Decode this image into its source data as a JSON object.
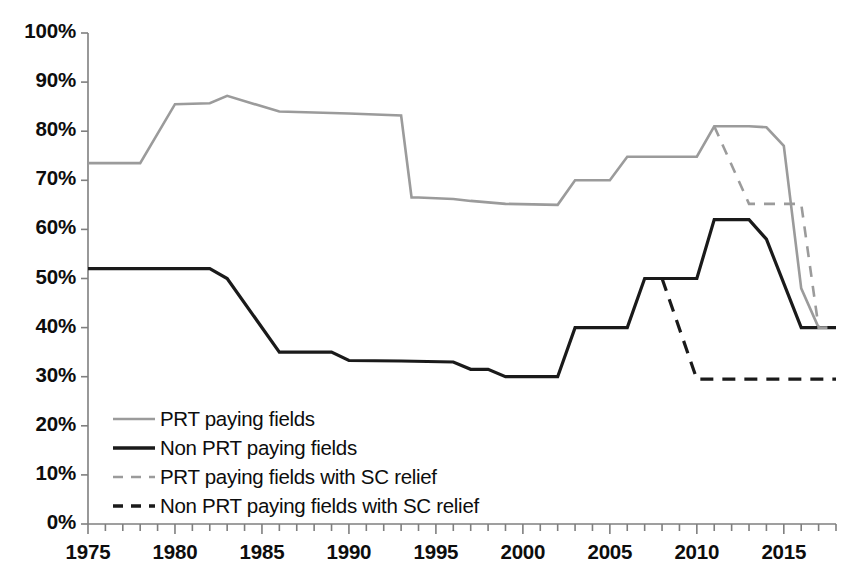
{
  "chart_data": {
    "type": "line",
    "title": "",
    "xlabel": "",
    "ylabel": "",
    "xlim": [
      1975,
      2018
    ],
    "ylim": [
      0,
      100
    ],
    "grid": false,
    "legend_position": "inside-bottom-left",
    "y_tick_labels": [
      "100%",
      "90%",
      "80%",
      "70%",
      "60%",
      "50%",
      "40%",
      "30%",
      "20%",
      "10%",
      "0%"
    ],
    "y_tick_values": [
      100,
      90,
      80,
      70,
      60,
      50,
      40,
      30,
      20,
      10,
      0
    ],
    "x_tick_labels": [
      "1975",
      "1980",
      "1985",
      "1990",
      "1995",
      "2000",
      "2005",
      "2010",
      "2015"
    ],
    "x_tick_values": [
      1975,
      1980,
      1985,
      1990,
      1995,
      2000,
      2005,
      2010,
      2015
    ],
    "x_minor_tick_interval": 1,
    "colors": {
      "prt_paying_fields": "#9b9b9b",
      "non_prt_paying_fields": "#1a1a1a",
      "prt_paying_fields_sc_relief": "#9b9b9b",
      "non_prt_paying_fields_sc_relief": "#1a1a1a",
      "axis": "#7f7f7f",
      "text": "#0d0d0d",
      "background": "#ffffff"
    },
    "series": [
      {
        "name": "PRT paying fields",
        "style": "solid",
        "color": "#9b9b9b",
        "width": 2.6,
        "x": [
          1975,
          1978,
          1980,
          1982,
          1983,
          1986,
          1990,
          1993,
          1993.6,
          1994,
          1996,
          1997,
          1999,
          2002,
          2003,
          2005,
          2006,
          2009,
          2010,
          2011,
          2013,
          2014,
          2015,
          2016,
          2017,
          2018
        ],
        "y": [
          73.5,
          73.5,
          85.5,
          85.7,
          87.2,
          84.0,
          83.6,
          83.2,
          66.5,
          66.5,
          66.2,
          65.8,
          65.2,
          65.0,
          70.0,
          70.0,
          74.8,
          74.8,
          74.8,
          81.0,
          81.0,
          80.8,
          77.0,
          48.0,
          40.0,
          40.0
        ]
      },
      {
        "name": "Non PRT paying fields",
        "style": "solid",
        "color": "#1a1a1a",
        "width": 3.2,
        "x": [
          1975,
          1982,
          1983,
          1986,
          1989,
          1990,
          1993,
          1996,
          1997,
          1998,
          1999,
          2002,
          2003,
          2006,
          2007,
          2010,
          2011,
          2013,
          2014,
          2016,
          2017,
          2018
        ],
        "y": [
          52.0,
          52.0,
          50.0,
          35.0,
          35.0,
          33.3,
          33.2,
          33.0,
          31.5,
          31.5,
          30.0,
          30.0,
          40.0,
          40.0,
          50.0,
          50.0,
          62.0,
          62.0,
          58.0,
          40.0,
          40.0,
          40.0
        ]
      },
      {
        "name": "PRT paying fields with SC relief",
        "style": "dashed",
        "color": "#9b9b9b",
        "width": 2.6,
        "x": [
          2011,
          2013,
          2016,
          2017,
          2018
        ],
        "y": [
          81.0,
          65.2,
          65.2,
          40.0,
          40.0
        ]
      },
      {
        "name": "Non PRT paying fields with SC relief",
        "style": "dashed",
        "color": "#1a1a1a",
        "width": 3.2,
        "x": [
          2008,
          2010,
          2016,
          2018
        ],
        "y": [
          50.0,
          29.5,
          29.5,
          29.5
        ]
      }
    ]
  },
  "legend": {
    "items": [
      {
        "label": "PRT paying fields",
        "style": "solid",
        "color": "#9b9b9b"
      },
      {
        "label": "Non PRT paying fields",
        "style": "solid",
        "color": "#1a1a1a"
      },
      {
        "label": "PRT paying fields with SC relief",
        "style": "dashed",
        "color": "#9b9b9b"
      },
      {
        "label": "Non PRT paying fields with SC relief",
        "style": "dashed",
        "color": "#1a1a1a"
      }
    ]
  }
}
